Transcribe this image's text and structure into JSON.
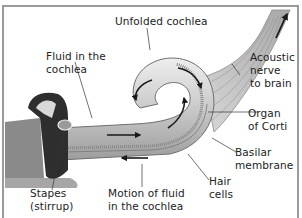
{
  "diagram": {
    "type": "anatomical illustration",
    "colors": {
      "border": "#9a9a9a",
      "tube_light": "#d6d6d6",
      "tube_mid": "#b5b5b5",
      "tube_dark": "#8a8a8a",
      "arrow": "#1a1a1a",
      "leader": "#333333",
      "text": "#222222"
    },
    "labels": {
      "unfolded_cochlea": "Unfolded cochlea",
      "fluid": "Fluid in the\ncochlea",
      "acoustic_nerve": "Acoustic\nnerve\nto brain",
      "organ_corti": "Organ\nof Corti",
      "basilar": "Basilar\nmembrane",
      "hair_cells": "Hair\ncells",
      "stapes": "Stapes\n(stirrup)",
      "motion": "Motion of fluid\nin the cochlea"
    }
  }
}
